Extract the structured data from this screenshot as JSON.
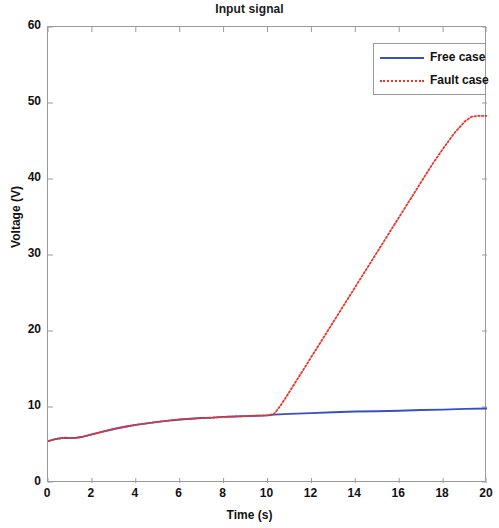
{
  "chart_data": {
    "type": "line",
    "title": "Input signal",
    "xlabel": "Time (s)",
    "ylabel": "Voltage (V)",
    "xlim": [
      0,
      20
    ],
    "ylim": [
      0,
      60
    ],
    "xticks": [
      0,
      2,
      4,
      6,
      8,
      10,
      12,
      14,
      16,
      18,
      20
    ],
    "yticks": [
      0,
      10,
      20,
      30,
      40,
      50,
      60
    ],
    "grid": false,
    "legend_position": "top-right",
    "legend": [
      "Free case",
      "Fault case"
    ],
    "colors": {
      "free_case": "#3a4fc4",
      "fault_case": "#e8372a",
      "axis": "#9a9a9a",
      "text": "#111111",
      "background": "#ffffff"
    },
    "series": [
      {
        "name": "Free case",
        "style": "solid",
        "color": "#3a4fc4",
        "x": [
          0.0,
          0.3,
          0.6,
          0.8,
          1.0,
          1.3,
          1.6,
          2.0,
          2.5,
          3.0,
          3.5,
          4.0,
          4.5,
          5.0,
          5.5,
          6.0,
          6.5,
          7.0,
          7.5,
          8.0,
          8.5,
          9.0,
          9.5,
          10.0,
          10.3,
          11.0,
          12.0,
          13.0,
          14.0,
          15.0,
          16.0,
          17.0,
          18.0,
          19.0,
          20.0
        ],
        "values": [
          5.5,
          5.75,
          5.9,
          5.95,
          5.9,
          5.95,
          6.1,
          6.4,
          6.75,
          7.1,
          7.4,
          7.65,
          7.85,
          8.05,
          8.2,
          8.35,
          8.45,
          8.55,
          8.6,
          8.7,
          8.75,
          8.8,
          8.85,
          8.9,
          9.0,
          9.1,
          9.2,
          9.3,
          9.4,
          9.45,
          9.5,
          9.6,
          9.65,
          9.75,
          9.8
        ]
      },
      {
        "name": "Fault case",
        "style": "dotted",
        "color": "#e8372a",
        "x": [
          0.0,
          0.3,
          0.6,
          0.8,
          1.0,
          1.3,
          1.6,
          2.0,
          2.5,
          3.0,
          3.5,
          4.0,
          4.5,
          5.0,
          5.5,
          6.0,
          6.5,
          7.0,
          7.5,
          8.0,
          8.5,
          9.0,
          9.5,
          10.0,
          10.3,
          10.6,
          11.0,
          11.5,
          12.0,
          12.5,
          13.0,
          13.5,
          14.0,
          14.5,
          15.0,
          15.5,
          16.0,
          16.5,
          17.0,
          17.5,
          18.0,
          18.5,
          19.0,
          19.3,
          19.6,
          20.0
        ],
        "values": [
          5.5,
          5.75,
          5.9,
          5.95,
          5.9,
          5.95,
          6.1,
          6.4,
          6.75,
          7.1,
          7.4,
          7.65,
          7.85,
          8.05,
          8.2,
          8.35,
          8.45,
          8.55,
          8.6,
          8.7,
          8.75,
          8.8,
          8.85,
          8.9,
          9.1,
          10.2,
          12.0,
          14.3,
          16.6,
          18.9,
          21.2,
          23.5,
          25.8,
          28.1,
          30.4,
          32.7,
          35.0,
          37.3,
          39.6,
          41.9,
          44.0,
          46.0,
          47.6,
          48.2,
          48.3,
          48.3
        ]
      }
    ]
  }
}
